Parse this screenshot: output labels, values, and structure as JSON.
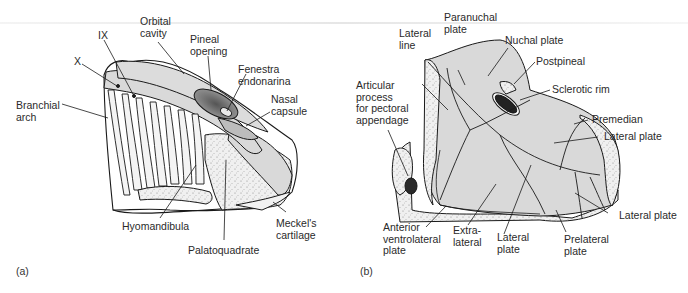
{
  "figure": {
    "panels": [
      {
        "id": "a",
        "label": "(a)",
        "labels": [
          {
            "key": "x",
            "text": "X"
          },
          {
            "key": "ix",
            "text": "IX"
          },
          {
            "key": "orbital",
            "text": "Orbital\ncavity"
          },
          {
            "key": "pineal",
            "text": "Pineal\nopening"
          },
          {
            "key": "fenestra",
            "text": "Fenestra\nendonarina"
          },
          {
            "key": "nasal",
            "text": "Nasal\ncapsule"
          },
          {
            "key": "branchial",
            "text": "Branchial\narch"
          },
          {
            "key": "hyomandibula",
            "text": "Hyomandibula"
          },
          {
            "key": "palatoquadrate",
            "text": "Palatoquadrate"
          },
          {
            "key": "meckel",
            "text": "Meckel's\ncartilage"
          }
        ]
      },
      {
        "id": "b",
        "label": "(b)",
        "labels": [
          {
            "key": "lateral_line",
            "text": "Lateral\nline"
          },
          {
            "key": "paranuchal",
            "text": "Paranuchal\nplate"
          },
          {
            "key": "nuchal",
            "text": "Nuchal plate"
          },
          {
            "key": "postpineal",
            "text": "Postpineal"
          },
          {
            "key": "sclerotic",
            "text": "Sclerotic rim"
          },
          {
            "key": "articular",
            "text": "Articular\nprocess\nfor pectoral\nappendage"
          },
          {
            "key": "premedian",
            "text": "Premedian"
          },
          {
            "key": "lateral_plate_upper",
            "text": "Lateral plate"
          },
          {
            "key": "lateral_plate_right",
            "text": "Lateral plate"
          },
          {
            "key": "anterior_ventrolateral",
            "text": "Anterior\nventrolateral\nplate"
          },
          {
            "key": "extralateral",
            "text": "Extra-\nlateral"
          },
          {
            "key": "lateral_plate_lower",
            "text": "Lateral\nplate"
          },
          {
            "key": "prelateral",
            "text": "Prelateral\nplate"
          }
        ]
      }
    ],
    "colors": {
      "ink": "#1a1a1a",
      "fill_gray": "#d9d9d9",
      "fill_dark": "#7a7a7a",
      "fill_light": "#ececec",
      "background": "#ffffff"
    }
  }
}
